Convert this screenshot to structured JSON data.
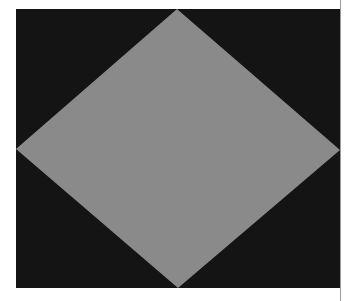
{
  "figure": {
    "shape": "diamond",
    "colors": {
      "background": "#141414",
      "diamond_fill": "#8a8a8a",
      "page": "#ffffff",
      "edge_line": "#9a9a9a"
    },
    "frame": {
      "x": 16,
      "y": 9,
      "width": 324,
      "height": 279
    },
    "diamond_vertices": {
      "top": [
        161,
        0
      ],
      "right": [
        324,
        141
      ],
      "bottom": [
        162,
        279
      ],
      "left": [
        0,
        140
      ]
    }
  }
}
